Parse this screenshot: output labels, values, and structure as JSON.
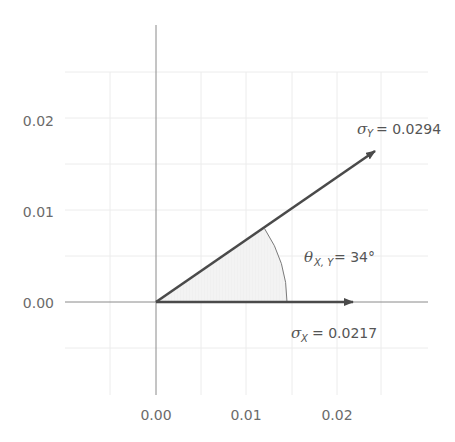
{
  "diagram": {
    "type": "vector-angle-diagram",
    "colors": {
      "background": "#ffffff",
      "grid": "#ececec",
      "axis": "#8a8a8a",
      "vector": "#4a4a4a",
      "arc": "#7a7a7a",
      "shade": "#f1f1f1",
      "text": "#6b6b6b"
    },
    "x_ticks": [
      {
        "label": "0.00",
        "value": 0.0
      },
      {
        "label": "0.01",
        "value": 0.01
      },
      {
        "label": "0.02",
        "value": 0.02
      }
    ],
    "y_ticks": [
      {
        "label": "0.02",
        "value": 0.02
      },
      {
        "label": "0.01",
        "value": 0.01
      },
      {
        "label": "0.00",
        "value": 0.0
      }
    ],
    "vectors": [
      {
        "name": "sigma_x",
        "symbol": "σ",
        "subscript": "X",
        "equals": "= 0.0217",
        "magnitude": 0.0217,
        "angle_deg": 0
      },
      {
        "name": "sigma_y",
        "symbol": "σ",
        "subscript": "Y",
        "equals": "= 0.0294",
        "magnitude": 0.0294,
        "angle_deg": 34
      }
    ],
    "angle": {
      "symbol": "θ",
      "subscript": "X, Y",
      "equals": "= 34°",
      "value_deg": 34
    }
  }
}
